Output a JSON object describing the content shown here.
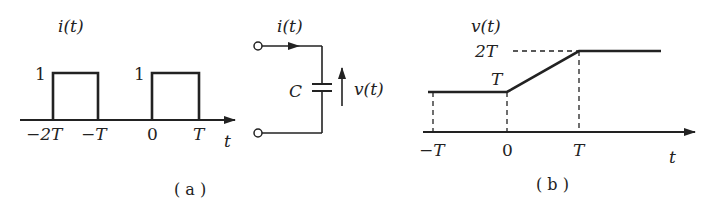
{
  "figure_a": {
    "caption": "( a )",
    "ylabel": "i(t)",
    "xlabel": "t",
    "pulse_level_labels": [
      "1",
      "1"
    ],
    "tick_labels": [
      "−2T",
      "−T",
      "0",
      "T"
    ],
    "pulses": [
      {
        "start": "-2T",
        "end": "-T",
        "height": 1
      },
      {
        "start": "0",
        "end": "T",
        "height": 1
      }
    ]
  },
  "circuit": {
    "current_label": "i(t)",
    "capacitor_label": "C",
    "voltage_label": "v(t)"
  },
  "figure_b": {
    "caption": "( b )",
    "ylabel": "v(t)",
    "xlabel": "t",
    "level_labels": [
      "2T",
      "T"
    ],
    "tick_labels": [
      "−T",
      "0",
      "T"
    ],
    "segments": [
      {
        "from": [
          "-T",
          "T"
        ],
        "to": [
          "0",
          "T"
        ]
      },
      {
        "from": [
          "0",
          "T"
        ],
        "to": [
          "T",
          "2T"
        ]
      },
      {
        "from": [
          "T",
          "2T"
        ],
        "to": [
          "end",
          "2T"
        ]
      }
    ]
  }
}
